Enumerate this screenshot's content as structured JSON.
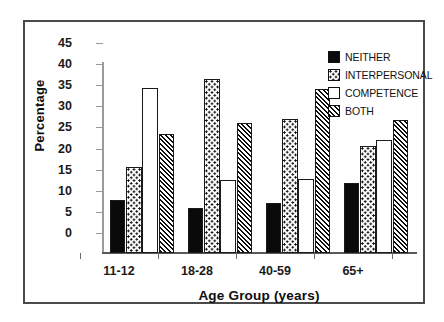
{
  "chart_data": {
    "type": "bar",
    "title": "",
    "xlabel": "Age Group (years)",
    "ylabel": "Percentage",
    "categories": [
      "11-12",
      "18-28",
      "40-59",
      "65+"
    ],
    "series": [
      {
        "name": "NEITHER",
        "pattern": "solid-black",
        "values": [
          12.5,
          10.7,
          11.9,
          16.6
        ]
      },
      {
        "name": "INTERPERSONAL",
        "pattern": "dotted",
        "values": [
          20.3,
          41.3,
          31.8,
          25.4
        ]
      },
      {
        "name": "COMPETENCE",
        "pattern": "white",
        "values": [
          39.1,
          17.3,
          17.5,
          26.8
        ]
      },
      {
        "name": "BOTH",
        "pattern": "diagonal-hatch",
        "values": [
          28.2,
          30.8,
          38.9,
          31.6
        ]
      }
    ],
    "ylim": [
      0,
      45
    ],
    "ytick_step": 5,
    "yticks": [
      "45",
      "40",
      "35",
      "30",
      "25",
      "20",
      "15",
      "10",
      "5",
      "0"
    ],
    "grid": false,
    "legend_position": "top-right",
    "legend": [
      "NEITHER",
      "INTERPERSONAL",
      "COMPETENCE",
      "BOTH"
    ]
  },
  "axes": {
    "y_title": "Percentage",
    "x_title": "Age Group (years)"
  },
  "colors": {
    "ink": "#0d0d0d",
    "frame": "#4a4a4a",
    "axis": "#8a8a8a",
    "background": "#ffffff"
  }
}
